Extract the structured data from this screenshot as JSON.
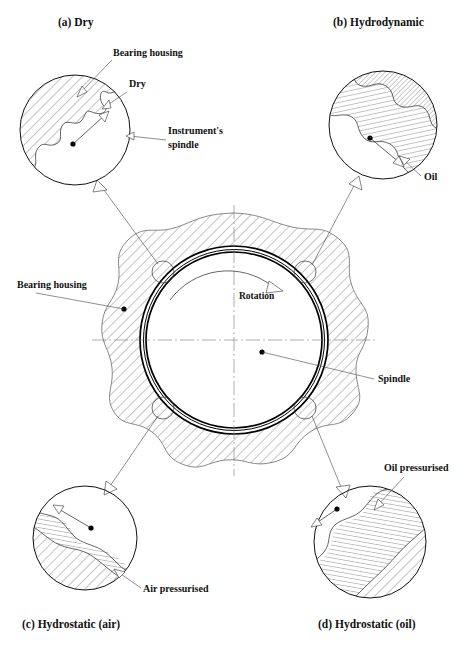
{
  "figure": {
    "title_visible": false,
    "background": "#ffffff",
    "ink": "#111111"
  },
  "captions": [
    {
      "id": "a",
      "label": "(a) Dry",
      "x": 58,
      "y": 26
    },
    {
      "id": "b",
      "label": "(b) Hydrodynamic",
      "x": 333,
      "y": 26
    },
    {
      "id": "c",
      "label": "(c) Hydrostatic (air)",
      "x": 22,
      "y": 628
    },
    {
      "id": "d",
      "label": "(d) Hydrostatic (oil)",
      "x": 318,
      "y": 628
    }
  ],
  "annotations": [
    {
      "name": "bearing-housing-top",
      "label": "Bearing housing",
      "x": 113,
      "y": 56,
      "anchor": "start"
    },
    {
      "name": "dry-label",
      "label": "Dry",
      "x": 129,
      "y": 87,
      "anchor": "start"
    },
    {
      "name": "instrument-spindle-1",
      "label": "Instrument's",
      "x": 168,
      "y": 134,
      "anchor": "start"
    },
    {
      "name": "instrument-spindle-2",
      "label": "spindle",
      "x": 168,
      "y": 148,
      "anchor": "start"
    },
    {
      "name": "oil-label",
      "label": "Oil",
      "x": 424,
      "y": 180,
      "anchor": "start"
    },
    {
      "name": "bearing-housing-main",
      "label": "Bearing housing",
      "x": 17,
      "y": 288,
      "anchor": "start"
    },
    {
      "name": "rotation-label",
      "label": "Rotation",
      "x": 239,
      "y": 299,
      "anchor": "start"
    },
    {
      "name": "spindle-label",
      "label": "Spindle",
      "x": 378,
      "y": 382,
      "anchor": "start"
    },
    {
      "name": "oil-pressurised-label",
      "label": "Oil pressurised",
      "x": 384,
      "y": 471,
      "anchor": "start"
    },
    {
      "name": "air-pressurised-label",
      "label": "Air pressurised",
      "x": 143,
      "y": 592,
      "anchor": "start"
    }
  ],
  "main_bearing": {
    "center_x": 234,
    "center_y": 340,
    "shaft_outer_radius": 94,
    "shaft_inner_radius": 89,
    "housing_mean_radius": 118,
    "rotation_direction": "clockwise",
    "spindle_dot": {
      "x": 262,
      "y": 352
    },
    "housing_dot": {
      "x": 124,
      "y": 309
    },
    "callout_markers": [
      {
        "id": "a",
        "x": 163,
        "y": 272
      },
      {
        "id": "b",
        "x": 305,
        "y": 272
      },
      {
        "id": "c",
        "x": 163,
        "y": 408
      },
      {
        "id": "d",
        "x": 305,
        "y": 408
      }
    ]
  },
  "detail_circles": [
    {
      "id": "a",
      "name": "detail-dry",
      "center_x": 75,
      "center_y": 130,
      "radius": 55,
      "film_type": "dry",
      "housing_hatch_angle_deg": 45,
      "has_film_layer": false,
      "spindle_dot": {
        "x": 73,
        "y": 144
      },
      "spindle_arrow_angle_deg": -42
    },
    {
      "id": "b",
      "name": "detail-hydrodynamic",
      "center_x": 383,
      "center_y": 125,
      "radius": 54,
      "film_type": "oil",
      "housing_hatch_angle_deg": 45,
      "has_film_layer": true,
      "film_hatch_angle_deg": 78,
      "spindle_dot": {
        "x": 370,
        "y": 138
      },
      "spindle_arrow_angle_deg": 35
    },
    {
      "id": "c",
      "name": "detail-hydrostatic-air",
      "center_x": 85,
      "center_y": 538,
      "radius": 52,
      "film_type": "air",
      "housing_hatch_angle_deg": 45,
      "has_film_layer": true,
      "film_hatch_angle_deg": 80,
      "spindle_dot": {
        "x": 91,
        "y": 528
      },
      "spindle_arrow_angle_deg": -140
    },
    {
      "id": "d",
      "name": "detail-hydrostatic-oil",
      "center_x": 370,
      "center_y": 542,
      "radius": 56,
      "film_type": "oil",
      "housing_hatch_angle_deg": 45,
      "has_film_layer": true,
      "film_hatch_angle_deg": 80,
      "spindle_dot": {
        "x": 337,
        "y": 509
      },
      "spindle_arrow_angle_deg": 200
    }
  ],
  "leaders": [
    {
      "name": "leader-main-to-a",
      "from": {
        "x": 160,
        "y": 268
      },
      "to": {
        "x": 96,
        "y": 182
      }
    },
    {
      "name": "leader-main-to-b",
      "from": {
        "x": 309,
        "y": 268
      },
      "to": {
        "x": 355,
        "y": 175
      }
    },
    {
      "name": "leader-main-to-c",
      "from": {
        "x": 160,
        "y": 412
      },
      "to": {
        "x": 106,
        "y": 487
      }
    },
    {
      "name": "leader-main-to-d",
      "from": {
        "x": 309,
        "y": 412
      },
      "to": {
        "x": 344,
        "y": 490
      }
    }
  ]
}
